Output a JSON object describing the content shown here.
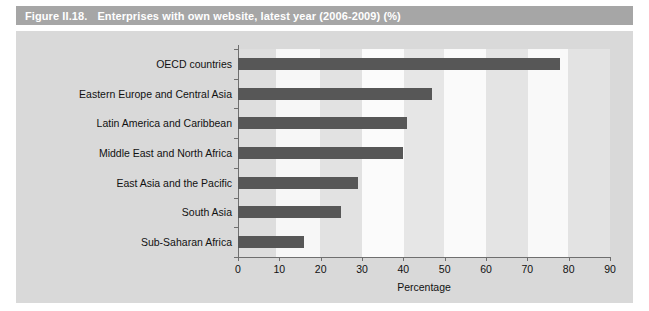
{
  "figure": {
    "number": "Figure II.18.",
    "caption": "Enterprises with own website, latest year (2006-2009) (%)",
    "title_bar_color": "#a6a6a6",
    "panel_color": "#d9d9d9",
    "bar_color": "#575757"
  },
  "chart_data": {
    "type": "bar",
    "orientation": "horizontal",
    "title": "Enterprises with own website, latest year (2006-2009) (%)",
    "categories": [
      "OECD countries",
      "Eastern Europe and Central Asia",
      "Latin America and Caribbean",
      "Middle East and North Africa",
      "East Asia and the Pacific",
      "South Asia",
      "Sub-Saharan Africa"
    ],
    "values": [
      78,
      47,
      41,
      40,
      29,
      25,
      16
    ],
    "xlabel": "Percentage",
    "ylabel": "",
    "xlim": [
      0,
      90
    ],
    "xticks": [
      0,
      10,
      20,
      30,
      40,
      50,
      60,
      70,
      80,
      90
    ],
    "xtick_labels": [
      "0",
      "10",
      "20",
      "30",
      "40",
      "50",
      "60",
      "70",
      "80",
      "90"
    ],
    "grid": false,
    "legend": null,
    "series": [
      {
        "name": "Enterprises with own website (%)",
        "values": [
          78,
          47,
          41,
          40,
          29,
          25,
          16
        ]
      }
    ]
  }
}
